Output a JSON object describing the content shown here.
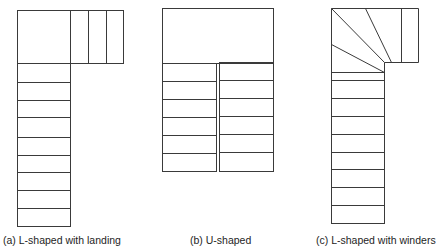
{
  "figure": {
    "stroke_color": "#3a3a3a",
    "background": "#ffffff",
    "panels": [
      {
        "id": "a",
        "caption": "(a) L-shaped with landing",
        "caption_pos": {
          "x": 3,
          "y": 234
        },
        "rects": [
          {
            "x": 17,
            "y": 10,
            "w": 53,
            "h": 53
          },
          {
            "x": 70,
            "y": 10,
            "w": 53,
            "h": 53
          },
          {
            "x": 17,
            "y": 63,
            "w": 53,
            "h": 163
          }
        ],
        "lines": [
          [
            88,
            10,
            88,
            63
          ],
          [
            106,
            10,
            106,
            63
          ],
          [
            17,
            82,
            70,
            82
          ],
          [
            17,
            100,
            70,
            100
          ],
          [
            17,
            117,
            70,
            117
          ],
          [
            17,
            137,
            70,
            137
          ],
          [
            17,
            155,
            70,
            155
          ],
          [
            17,
            172,
            70,
            172
          ],
          [
            17,
            190,
            70,
            190
          ],
          [
            17,
            208,
            70,
            208
          ]
        ]
      },
      {
        "id": "b",
        "caption": "(b) U-shaped",
        "caption_pos": {
          "x": 190,
          "y": 234
        },
        "rects": [
          {
            "x": 162,
            "y": 8,
            "w": 111,
            "h": 55
          },
          {
            "x": 162,
            "y": 63,
            "w": 54,
            "h": 108
          },
          {
            "x": 219,
            "y": 62,
            "w": 54,
            "h": 109
          }
        ],
        "lines": [
          [
            162,
            81,
            216,
            81
          ],
          [
            162,
            99,
            216,
            99
          ],
          [
            162,
            117,
            216,
            117
          ],
          [
            162,
            135,
            216,
            135
          ],
          [
            162,
            153,
            216,
            153
          ],
          [
            219,
            80,
            273,
            80
          ],
          [
            219,
            98,
            273,
            98
          ],
          [
            219,
            116,
            273,
            116
          ],
          [
            219,
            134,
            273,
            134
          ],
          [
            219,
            152,
            273,
            152
          ]
        ]
      },
      {
        "id": "c",
        "caption": "(c) L-shaped with winders",
        "caption_pos": {
          "x": 316,
          "y": 234
        },
        "rects": [
          {
            "x": 331,
            "y": 72,
            "w": 53,
            "h": 151
          }
        ],
        "lines": [
          [
            331,
            8,
            418,
            8
          ],
          [
            331,
            8,
            331,
            72
          ],
          [
            418,
            8,
            418,
            62
          ],
          [
            384,
            62,
            418,
            62
          ],
          [
            384,
            62,
            384,
            72
          ],
          [
            401,
            8,
            401,
            62
          ],
          [
            331,
            8,
            384,
            62
          ],
          [
            365,
            8,
            391,
            62
          ],
          [
            331,
            44,
            384,
            72
          ],
          [
            331,
            80,
            384,
            80
          ],
          [
            331,
            98,
            384,
            98
          ],
          [
            331,
            116,
            384,
            116
          ],
          [
            331,
            134,
            384,
            134
          ],
          [
            331,
            152,
            384,
            152
          ],
          [
            331,
            169,
            384,
            169
          ],
          [
            331,
            187,
            384,
            187
          ],
          [
            331,
            205,
            384,
            205
          ]
        ]
      }
    ]
  }
}
